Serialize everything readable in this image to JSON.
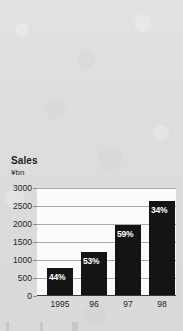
{
  "figure": {
    "title": "Sales",
    "unit_label": "¥bn"
  },
  "chart_data": {
    "type": "bar",
    "title": "Sales",
    "subtitle": "",
    "xlabel": "",
    "ylabel": "¥bn",
    "categories": [
      "1995",
      "96",
      "97",
      "98"
    ],
    "values": [
      750,
      1200,
      1950,
      2600
    ],
    "data_labels": [
      "44%",
      "53%",
      "59%",
      "34%"
    ],
    "ylim": [
      0,
      3000
    ],
    "ytick_labels": [
      "3000",
      "2500",
      "2000",
      "1500",
      "1000",
      "500",
      "0"
    ],
    "ytick_values": [
      3000,
      2500,
      2000,
      1500,
      1000,
      500,
      0
    ],
    "grid": true,
    "legend": "none",
    "series": [
      {
        "name": "Sales",
        "values": [
          750,
          1200,
          1950,
          2600
        ],
        "labels": [
          "44%",
          "53%",
          "59%",
          "34%"
        ],
        "color": "#141414"
      }
    ],
    "colors": {
      "bar": "#141414",
      "plot_background": "#fbfbfb",
      "page_background": "#dcdcdc",
      "gridline": "#a9a9a9",
      "axis": "#3a3a3a",
      "text": "#1f1f1f",
      "data_label_text": "#ffffff"
    }
  }
}
